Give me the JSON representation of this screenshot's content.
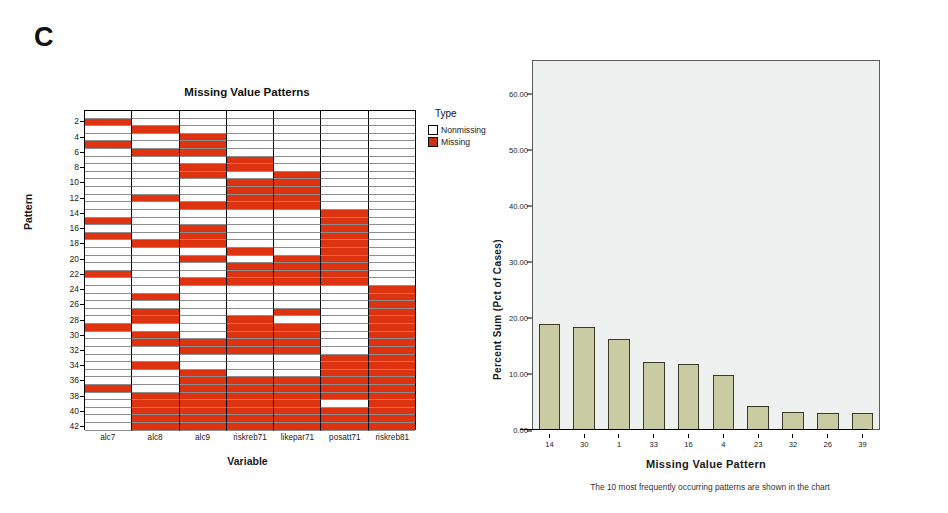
{
  "panels": {
    "c_letter": "C",
    "d_letter": "d"
  },
  "heatmap": {
    "title": "Missing Value Patterns",
    "ylabel": "Pattern",
    "xlabel": "Variable",
    "legend_title": "Type",
    "legend": [
      {
        "label": "Nonmissing",
        "color": "#ffffff"
      },
      {
        "label": "Missing",
        "color": "#cc3311"
      }
    ],
    "colors": {
      "missing": "#dd3311",
      "nonmissing": "#ffffff"
    },
    "chart_data": {
      "type": "heatmap",
      "title": "Missing Value Patterns",
      "xlabel": "Variable",
      "ylabel": "Pattern",
      "grid": true,
      "legend_position": "right",
      "categories": [
        "alc7",
        "alc8",
        "alc9",
        "riskreb71",
        "likepar71",
        "posatt71",
        "riskreb81"
      ],
      "ytick_labels": [
        "2",
        "4",
        "6",
        "8",
        "10",
        "12",
        "14",
        "16",
        "18",
        "20",
        "22",
        "24",
        "26",
        "28",
        "30",
        "32",
        "34",
        "36",
        "38",
        "40",
        "42"
      ],
      "row_ids": [
        1,
        2,
        3,
        4,
        5,
        6,
        7,
        8,
        9,
        10,
        11,
        12,
        13,
        14,
        15,
        16,
        17,
        18,
        19,
        20,
        21,
        22,
        23,
        24,
        25,
        26,
        27,
        28,
        29,
        30,
        31,
        32,
        33,
        34,
        35,
        36,
        37,
        38,
        39,
        40,
        41,
        42
      ],
      "value_legend": {
        "0": "Nonmissing",
        "1": "Missing"
      },
      "matrix": [
        [
          0,
          0,
          0,
          0,
          0,
          0,
          0
        ],
        [
          1,
          0,
          0,
          0,
          0,
          0,
          0
        ],
        [
          0,
          1,
          0,
          0,
          0,
          0,
          0
        ],
        [
          0,
          0,
          1,
          0,
          0,
          0,
          0
        ],
        [
          1,
          0,
          1,
          0,
          0,
          0,
          0
        ],
        [
          0,
          1,
          1,
          0,
          0,
          0,
          0
        ],
        [
          0,
          0,
          0,
          1,
          0,
          0,
          0
        ],
        [
          0,
          0,
          1,
          1,
          0,
          0,
          0
        ],
        [
          0,
          0,
          1,
          0,
          1,
          0,
          0
        ],
        [
          0,
          0,
          0,
          1,
          1,
          0,
          0
        ],
        [
          0,
          0,
          0,
          1,
          1,
          0,
          0
        ],
        [
          0,
          1,
          0,
          1,
          1,
          0,
          0
        ],
        [
          0,
          0,
          1,
          1,
          1,
          0,
          0
        ],
        [
          0,
          0,
          0,
          0,
          0,
          1,
          0
        ],
        [
          1,
          0,
          0,
          0,
          0,
          1,
          0
        ],
        [
          0,
          0,
          1,
          0,
          0,
          1,
          0
        ],
        [
          1,
          0,
          1,
          0,
          0,
          1,
          0
        ],
        [
          0,
          1,
          1,
          0,
          0,
          1,
          0
        ],
        [
          0,
          0,
          0,
          1,
          0,
          1,
          0
        ],
        [
          0,
          0,
          1,
          0,
          1,
          1,
          0
        ],
        [
          0,
          0,
          0,
          1,
          1,
          1,
          0
        ],
        [
          1,
          0,
          0,
          1,
          1,
          1,
          0
        ],
        [
          0,
          0,
          1,
          1,
          1,
          1,
          0
        ],
        [
          0,
          0,
          0,
          0,
          0,
          0,
          1
        ],
        [
          0,
          1,
          0,
          0,
          0,
          0,
          1
        ],
        [
          0,
          0,
          0,
          0,
          0,
          0,
          1
        ],
        [
          0,
          1,
          0,
          0,
          1,
          0,
          1
        ],
        [
          0,
          1,
          0,
          1,
          0,
          0,
          1
        ],
        [
          1,
          0,
          0,
          1,
          1,
          0,
          1
        ],
        [
          0,
          1,
          0,
          1,
          1,
          0,
          1
        ],
        [
          0,
          1,
          1,
          1,
          1,
          0,
          1
        ],
        [
          0,
          0,
          1,
          1,
          1,
          0,
          1
        ],
        [
          0,
          0,
          0,
          0,
          0,
          1,
          1
        ],
        [
          0,
          1,
          0,
          0,
          0,
          1,
          1
        ],
        [
          0,
          0,
          1,
          0,
          0,
          1,
          1
        ],
        [
          0,
          0,
          1,
          1,
          1,
          1,
          1
        ],
        [
          1,
          0,
          1,
          1,
          1,
          1,
          1
        ],
        [
          0,
          1,
          1,
          1,
          1,
          1,
          1
        ],
        [
          0,
          1,
          1,
          1,
          1,
          0,
          1
        ],
        [
          0,
          1,
          1,
          1,
          1,
          1,
          1
        ],
        [
          0,
          1,
          1,
          1,
          1,
          1,
          1
        ],
        [
          0,
          1,
          1,
          1,
          1,
          1,
          1
        ]
      ]
    }
  },
  "barchart": {
    "ylabel": "Percent Sum (Pct of Cases)",
    "xlabel": "Missing Value Pattern",
    "caption": "The 10 most frequently occurring patterns are shown in the chart",
    "bar_color": "#c9cba3",
    "plot_background": "#eef1f0",
    "chart_data": {
      "type": "bar",
      "title": "",
      "xlabel": "Missing Value Pattern",
      "ylabel": "Percent Sum (Pct of Cases)",
      "categories": [
        "14",
        "30",
        "1",
        "33",
        "16",
        "4",
        "23",
        "32",
        "26",
        "39"
      ],
      "values": [
        18.9,
        18.3,
        16.2,
        12.1,
        11.7,
        9.9,
        4.3,
        3.2,
        3.1,
        3.0
      ],
      "ylim": [
        0,
        66
      ],
      "ytick_labels": [
        "0.00",
        "10.00",
        "20.00",
        "30.00",
        "40.00",
        "50.00",
        "60.00"
      ],
      "ytick_values": [
        0,
        10,
        20,
        30,
        40,
        50,
        60
      ],
      "grid": false,
      "legend_position": "none"
    }
  }
}
